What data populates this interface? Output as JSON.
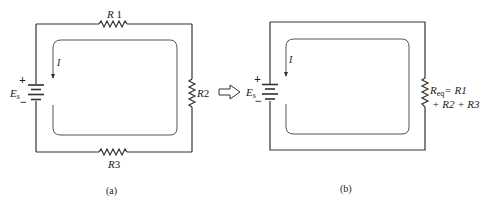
{
  "circuit_a": {
    "caption": "(a)",
    "resistors": [
      {
        "id": "R1",
        "label_italic": "R",
        "label_num": " 1"
      },
      {
        "id": "R2",
        "label_italic": "R",
        "label_num": "2"
      },
      {
        "id": "R3",
        "label_italic": "R",
        "label_num": "3"
      }
    ],
    "source": {
      "label_italic": "E",
      "label_sub": "s",
      "plus": "+",
      "minus": "−"
    },
    "current": {
      "label": "I"
    }
  },
  "transform_arrow": "hollow-right-arrow",
  "circuit_b": {
    "caption": "(b)",
    "equivalent": {
      "line1_italic": "R",
      "line1_sub": "eq",
      "line1_rest": "= R1",
      "line2": "+ R2 + R3"
    },
    "source": {
      "label_italic": "E",
      "label_sub": "s",
      "plus": "+",
      "minus": "−"
    },
    "current": {
      "label": "I"
    }
  },
  "colors": {
    "line": "#333333",
    "loop": "#555555",
    "text": "#1a1a1a"
  }
}
